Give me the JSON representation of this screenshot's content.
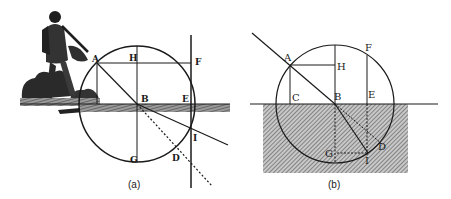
{
  "figure": {
    "panels": [
      {
        "id": "a",
        "caption": "(a)",
        "labels": {
          "A": "A",
          "H": "H",
          "F": "F",
          "B": "B",
          "E": "E",
          "I": "I",
          "G": "G",
          "D": "D"
        }
      },
      {
        "id": "b",
        "caption": "(b)",
        "labels": {
          "A": "A",
          "H": "H",
          "F": "F",
          "C": "C",
          "B": "B",
          "E": "E",
          "G": "G",
          "I": "I",
          "D": "D"
        }
      }
    ],
    "colors": {
      "ink": "#1a1a1a",
      "hatch_bg": "#bdbdbd",
      "paper": "#ffffff"
    }
  }
}
